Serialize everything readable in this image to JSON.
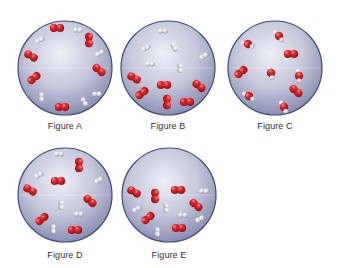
{
  "colors": {
    "sphere_outer": "#8d90b4",
    "sphere_inner": "#e6e7f2",
    "sphere_rim": "#3d4a7a",
    "oxygen": "#d21e24",
    "oxygen_highlight": "#ff8a84",
    "hydrogen": "#e8e8ea",
    "hydrogen_shade": "#a6a8ae"
  },
  "figures": [
    {
      "id": "A",
      "label": "Figure A",
      "cx": 65,
      "cy": 68,
      "r": 47,
      "label_y": 121,
      "molecules": [
        {
          "type": "O2",
          "x": 57,
          "y": 28,
          "angle": 0
        },
        {
          "type": "H2",
          "x": 78,
          "y": 30,
          "angle": 0
        },
        {
          "type": "O2",
          "x": 89,
          "y": 40,
          "angle": 90
        },
        {
          "type": "H2",
          "x": 100,
          "y": 53,
          "angle": -30
        },
        {
          "type": "O2",
          "x": 99,
          "y": 70,
          "angle": 40
        },
        {
          "type": "H2",
          "x": 97,
          "y": 94,
          "angle": 0
        },
        {
          "type": "H2",
          "x": 84,
          "y": 102,
          "angle": 60
        },
        {
          "type": "O2",
          "x": 62,
          "y": 107,
          "angle": 0
        },
        {
          "type": "H2",
          "x": 41,
          "y": 97,
          "angle": 90
        },
        {
          "type": "O2",
          "x": 34,
          "y": 78,
          "angle": -40
        },
        {
          "type": "O2",
          "x": 31,
          "y": 56,
          "angle": 30
        },
        {
          "type": "H2",
          "x": 40,
          "y": 40,
          "angle": -30
        }
      ]
    },
    {
      "id": "B",
      "label": "Figure B",
      "cx": 168,
      "cy": 68,
      "r": 47,
      "label_y": 121,
      "molecules": [
        {
          "type": "H2",
          "x": 163,
          "y": 31,
          "angle": 0
        },
        {
          "type": "H2",
          "x": 146,
          "y": 48,
          "angle": -30
        },
        {
          "type": "H2",
          "x": 174,
          "y": 47,
          "angle": 60
        },
        {
          "type": "H2",
          "x": 204,
          "y": 56,
          "angle": -30
        },
        {
          "type": "H2",
          "x": 150,
          "y": 64,
          "angle": 0
        },
        {
          "type": "H2",
          "x": 180,
          "y": 68,
          "angle": 90
        },
        {
          "type": "O2",
          "x": 134,
          "y": 78,
          "angle": 30
        },
        {
          "type": "O2",
          "x": 164,
          "y": 85,
          "angle": 0
        },
        {
          "type": "O2",
          "x": 199,
          "y": 86,
          "angle": 40
        },
        {
          "type": "O2",
          "x": 142,
          "y": 93,
          "angle": -40
        },
        {
          "type": "O2",
          "x": 167,
          "y": 102,
          "angle": 90
        },
        {
          "type": "O2",
          "x": 187,
          "y": 102,
          "angle": 0
        }
      ]
    },
    {
      "id": "C",
      "label": "Figure C",
      "cx": 275,
      "cy": 68,
      "r": 47,
      "label_y": 121,
      "molecules": [
        {
          "type": "H2O",
          "x": 279,
          "y": 36,
          "angle": 0
        },
        {
          "type": "H2O",
          "x": 248,
          "y": 44,
          "angle": -30
        },
        {
          "type": "O2",
          "x": 291,
          "y": 54,
          "angle": 0
        },
        {
          "type": "O2",
          "x": 241,
          "y": 72,
          "angle": -40
        },
        {
          "type": "H2O",
          "x": 271,
          "y": 73,
          "angle": 20
        },
        {
          "type": "H2O",
          "x": 299,
          "y": 76,
          "angle": 30
        },
        {
          "type": "H2O",
          "x": 249,
          "y": 96,
          "angle": -20
        },
        {
          "type": "O2",
          "x": 296,
          "y": 91,
          "angle": 40
        },
        {
          "type": "H2O",
          "x": 284,
          "y": 107,
          "angle": 10
        }
      ]
    },
    {
      "id": "D",
      "label": "Figure D",
      "cx": 65,
      "cy": 195,
      "r": 47,
      "label_y": 250,
      "molecules": [
        {
          "type": "H2",
          "x": 59,
          "y": 154,
          "angle": 0
        },
        {
          "type": "O2",
          "x": 79,
          "y": 165,
          "angle": 90
        },
        {
          "type": "H2",
          "x": 39,
          "y": 175,
          "angle": -30
        },
        {
          "type": "O2",
          "x": 58,
          "y": 181,
          "angle": 0
        },
        {
          "type": "H2",
          "x": 99,
          "y": 180,
          "angle": -30
        },
        {
          "type": "O2",
          "x": 30,
          "y": 190,
          "angle": 30
        },
        {
          "type": "O2",
          "x": 90,
          "y": 201,
          "angle": 40
        },
        {
          "type": "H2",
          "x": 61,
          "y": 205,
          "angle": 90
        },
        {
          "type": "H2",
          "x": 79,
          "y": 214,
          "angle": 0
        },
        {
          "type": "O2",
          "x": 42,
          "y": 219,
          "angle": -40
        },
        {
          "type": "H2",
          "x": 53,
          "y": 229,
          "angle": 90
        },
        {
          "type": "O2",
          "x": 75,
          "y": 230,
          "angle": 0
        }
      ]
    },
    {
      "id": "E",
      "label": "Figure E",
      "cx": 169,
      "cy": 195,
      "r": 47,
      "label_y": 250,
      "molecules": [
        {
          "type": "O2",
          "x": 134,
          "y": 192,
          "angle": 30
        },
        {
          "type": "O2",
          "x": 155,
          "y": 196,
          "angle": 90
        },
        {
          "type": "O2",
          "x": 178,
          "y": 190,
          "angle": 0
        },
        {
          "type": "H2",
          "x": 204,
          "y": 191,
          "angle": 0
        },
        {
          "type": "O2",
          "x": 196,
          "y": 205,
          "angle": 40
        },
        {
          "type": "H2",
          "x": 137,
          "y": 209,
          "angle": -30
        },
        {
          "type": "H2",
          "x": 166,
          "y": 208,
          "angle": 90
        },
        {
          "type": "H2",
          "x": 183,
          "y": 215,
          "angle": 0
        },
        {
          "type": "H2",
          "x": 200,
          "y": 219,
          "angle": -30
        },
        {
          "type": "O2",
          "x": 148,
          "y": 218,
          "angle": -40
        },
        {
          "type": "H2",
          "x": 157,
          "y": 232,
          "angle": 90
        },
        {
          "type": "O2",
          "x": 179,
          "y": 228,
          "angle": 0
        }
      ]
    }
  ]
}
